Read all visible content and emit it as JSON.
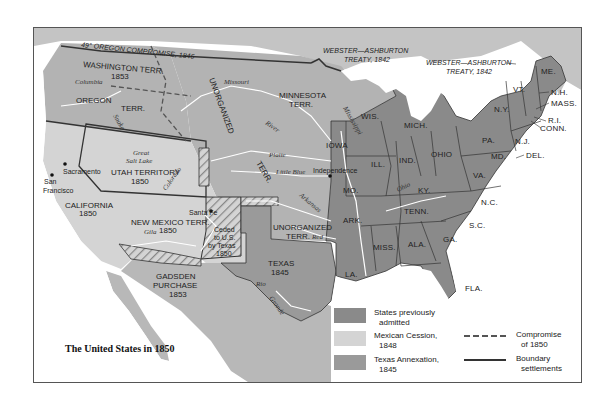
{
  "map": {
    "title": "The United States in 1850",
    "colors": {
      "states_previously_admitted": "#8a8a8a",
      "mexican_cession": "#d4d4d4",
      "texas_annexation": "#9a9a9a",
      "territory": "#b3b3b3",
      "foreign": "#c4c4c4",
      "water": "#ffffff",
      "border": "#333333"
    },
    "treaties": {
      "oregon": "49° OREGON COMPROMISE, 1846",
      "webster_west_line1": "WEBSTER—ASHBURTON",
      "webster_west_line2": "TREATY, 1842",
      "webster_east_line1": "WEBSTER—ASHBURTON",
      "webster_east_line2": "TREATY, 1842"
    },
    "territories": {
      "washington_line1": "WASHINGTON TERR.",
      "washington_line2": "1853",
      "oregon_line1": "OREGON",
      "oregon_line2": "TERR.",
      "unorganized": "UNORGANIZED",
      "minnesota_line1": "MINNESOTA",
      "minnesota_line2": "TERR.",
      "utah_line1": "UTAH TERRITORY",
      "utah_line2": "1850",
      "new_mexico_line1": "NEW MEXICO TERR.",
      "new_mexico_line2": "1850",
      "ceded_line1": "Ceded",
      "ceded_line2": "to U.S.",
      "ceded_line3": "by Texas",
      "ceded_line4": "1850",
      "unorganized_south_line1": "UNORGANIZED",
      "unorganized_south_line2": "TERR.",
      "gadsden_line1": "GADSDEN",
      "gadsden_line2": "PURCHASE",
      "gadsden_line3": "1853",
      "california_line1": "CALIFORNIA",
      "california_line2": "1850",
      "texas_line1": "TEXAS",
      "texas_line2": "1845",
      "terr_plains": "TERR."
    },
    "states": [
      "IOWA",
      "WIS.",
      "MICH.",
      "ILL.",
      "IND.",
      "OHIO",
      "MO.",
      "KY.",
      "ARK.",
      "TENN.",
      "MISS.",
      "ALA.",
      "GA.",
      "LA.",
      "FLA.",
      "S.C.",
      "N.C.",
      "VA.",
      "PA.",
      "N.Y.",
      "VT.",
      "ME.",
      "N.H.",
      "MASS.",
      "R.I.",
      "CONN.",
      "N.J.",
      "MD.",
      "DEL."
    ],
    "cities": [
      "Sacramento",
      "San",
      "Francisco",
      "Santa Fe",
      "Independence"
    ],
    "features": [
      "Great",
      "Salt Lake"
    ],
    "rivers": [
      "Columbia",
      "Snake",
      "R.",
      "Missouri",
      "River",
      "Platte",
      "R.",
      "Little Blue",
      "R.",
      "Arkansas",
      "R.",
      "Red",
      "Colorado",
      "Gila",
      "R.",
      "Rio",
      "Grande",
      "Mississippi",
      "River",
      "Ohio",
      "R.",
      "Ohio",
      "R."
    ]
  },
  "legend": {
    "items": [
      {
        "line1": "States previously",
        "line2": "admitted",
        "color": "#8a8a8a"
      },
      {
        "line1": "Mexican Cession,",
        "line2": "1848",
        "color": "#d4d4d4"
      },
      {
        "line1": "Texas Annexation,",
        "line2": "1845",
        "color": "#9a9a9a"
      }
    ],
    "lines": [
      {
        "line1": "Compromise",
        "line2": "of 1850",
        "style": "dashed"
      },
      {
        "line1": "Boundary",
        "line2": "settlements",
        "style": "solid"
      }
    ]
  }
}
